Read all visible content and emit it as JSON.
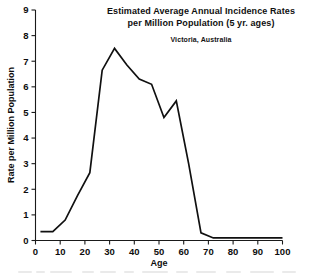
{
  "chart_data": {
    "type": "line",
    "title": "Estimated Average Annual Incidence Rates per Million Population (5 yr. ages)",
    "title_lines": [
      "Estimated Average Annual Incidence Rates",
      "per Million Population (5 yr. ages)"
    ],
    "subtitle": "Victoria, Australia",
    "xlabel": "Age",
    "ylabel": "Rate per Million Population",
    "xlim": [
      0,
      100
    ],
    "ylim": [
      0,
      9
    ],
    "xticks": [
      0,
      10,
      20,
      30,
      40,
      50,
      60,
      70,
      80,
      90,
      100
    ],
    "yticks": [
      0,
      1,
      2,
      3,
      4,
      5,
      6,
      7,
      8,
      9
    ],
    "xtick_labels": [
      "0",
      "10",
      "20",
      "30",
      "40",
      "50",
      "60",
      "70",
      "80",
      "90",
      "100"
    ],
    "ytick_labels": [
      "0",
      "1",
      "2",
      "3",
      "4",
      "5",
      "6",
      "7",
      "8",
      "9"
    ],
    "grid": false,
    "legend": false,
    "series": [
      {
        "name": "Incidence rate",
        "color": "#101010",
        "x": [
          2,
          7,
          12,
          17,
          22,
          27,
          32,
          37,
          42,
          47,
          52,
          57,
          62,
          67,
          72,
          77,
          82,
          87,
          92,
          97,
          100
        ],
        "values": [
          0.35,
          0.35,
          0.8,
          1.75,
          2.65,
          6.65,
          7.5,
          6.85,
          6.3,
          6.1,
          4.8,
          5.45,
          3.0,
          0.3,
          0.1,
          0.1,
          0.1,
          0.1,
          0.1,
          0.1,
          0.1
        ]
      }
    ]
  },
  "axes": {
    "x_axis_name": "age-axis",
    "y_axis_name": "rate-axis"
  }
}
